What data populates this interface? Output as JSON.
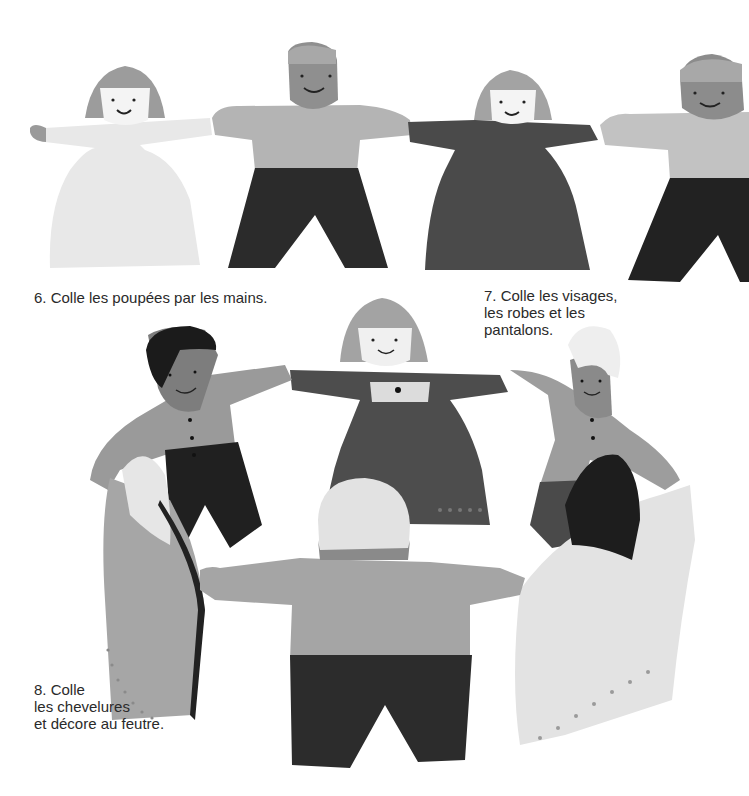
{
  "page": {
    "steps": [
      {
        "number": "6.",
        "lines": [
          "Colle les poupées par les mains."
        ]
      },
      {
        "number": "7.",
        "lines": [
          "Colle les visages,",
          "les robes et les",
          "pantalons."
        ]
      },
      {
        "number": "8.",
        "lines": [
          "Colle",
          "les chevelures",
          "et décore au feutre."
        ]
      }
    ],
    "text": {
      "step6_line1": "6. Colle les poupées par les mains.",
      "step7_line1": "7. Colle les visages,",
      "step7_line2": "les robes et les",
      "step7_line3": "pantalons.",
      "step8_line1": "8. Colle",
      "step8_line2": "les chevelures",
      "step8_line3": "et décore au feutre."
    },
    "illustrations": [
      {
        "name": "paper-doll-chain",
        "description": "Row of four paper dolls holding hands: girl in white dress, boy with grey shirt and black trousers, girl in dark dress, boy cut off at right edge"
      },
      {
        "name": "paper-doll-ring",
        "description": "Six paper dolls standing in a circle holding hands"
      }
    ],
    "colors": {
      "background": "#ffffff",
      "text": "#2a2a2a",
      "paper_white": "#e9e9e9",
      "paper_light": "#c4c4c4",
      "paper_mid": "#a8a8a8",
      "paper_dark": "#4a4a4a",
      "paper_black": "#1f1f1f"
    }
  }
}
